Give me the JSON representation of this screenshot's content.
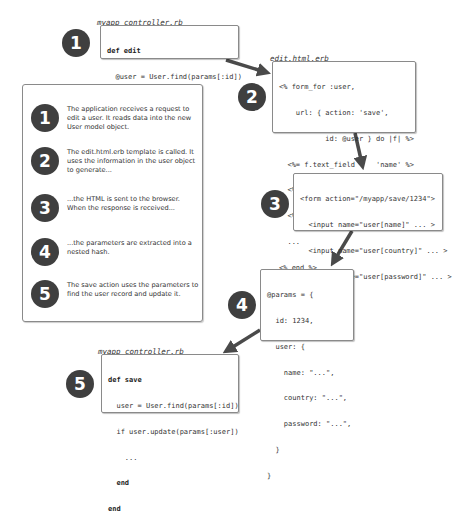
{
  "steps": [
    {
      "number": "1",
      "filename": "myapp_controller.rb",
      "code": [
        "def edit",
        "  @user = User.find(params[:id])",
        "end"
      ]
    },
    {
      "number": "2",
      "filename": "edit.html.erb",
      "code": [
        "<% form_for :user,",
        "    url: { action: 'save',",
        "           id: @user } do |f| %>",
        "  <%= f.text_field     'name' %>",
        "  <%= f.text_field     'country' %>",
        "  <%= f.password_field 'password' %>",
        "  ...",
        "<% end %>"
      ]
    },
    {
      "number": "3",
      "code": [
        "<form action=\"/myapp/save/1234\">",
        "  <input name=\"user[name]\" ... >",
        "  <input name=\"user[country]\" ... >",
        "  <input name=\"user[password]\" ... >",
        "  ...",
        "</form>"
      ]
    },
    {
      "number": "4",
      "code": [
        "@params = {",
        "  id: 1234,",
        "  user: {",
        "    name: \"...\",",
        "    country: \"...\",",
        "    password: \"...\",",
        "  }",
        "}"
      ]
    },
    {
      "number": "5",
      "filename": "myapp_controller.rb",
      "code": [
        "def save",
        "  user = User.find(params[:id])",
        "  if user.update(params[:user])",
        "    ...",
        "  end",
        "end"
      ]
    }
  ],
  "legend": [
    {
      "number": "1",
      "text": "The application receives a request to edit a user. It reads data into the new User model object."
    },
    {
      "number": "2",
      "text": "The edit.html.erb template is called. It uses the information in the user object to generate..."
    },
    {
      "number": "3",
      "text": "...the HTML is sent to the browser. When the response is received..."
    },
    {
      "number": "4",
      "text": "...the parameters are extracted into a nested hash."
    },
    {
      "number": "5",
      "text": "The save action uses the parameters to find the user record and update it."
    }
  ],
  "colors": {
    "circle": "#3f3f3f",
    "arrow": "#4a4a4a",
    "border": "#8a8a8a"
  }
}
